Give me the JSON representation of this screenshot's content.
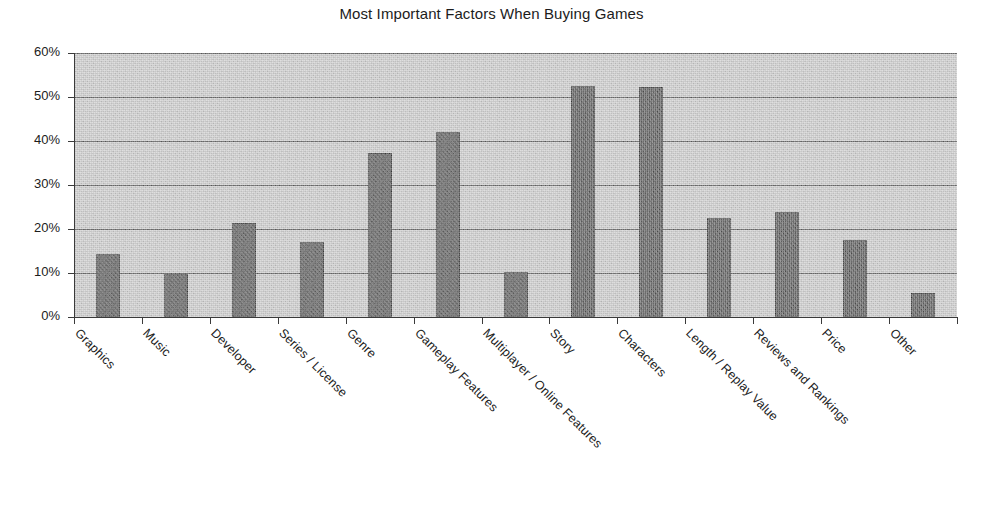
{
  "chart_data": {
    "type": "bar",
    "title": "Most Important Factors When Buying Games",
    "xlabel": "",
    "ylabel": "",
    "ylim": [
      0,
      60
    ],
    "y_tick_labels": [
      "0%",
      "10%",
      "20%",
      "30%",
      "40%",
      "50%",
      "60%"
    ],
    "y_tick_values": [
      0,
      10,
      20,
      30,
      40,
      50,
      60
    ],
    "grid": true,
    "legend": "none",
    "value_unit": "%",
    "categories": [
      "Graphics",
      "Music",
      "Developer",
      "Series / License",
      "Genre",
      "Gameplay Features",
      "Multiplayer / Online Features",
      "Story",
      "Characters",
      "Length / Replay Value",
      "Reviews and Rankings",
      "Price",
      "Other"
    ],
    "values": [
      14.3,
      9.7,
      21.3,
      17.0,
      37.2,
      42.0,
      10.2,
      52.6,
      52.2,
      22.5,
      23.9,
      17.5,
      5.5
    ],
    "series": [
      {
        "name": "Share of respondents",
        "values": [
          14.3,
          9.7,
          21.3,
          17.0,
          37.2,
          42.0,
          10.2,
          52.6,
          52.2,
          22.5,
          23.9,
          17.5,
          5.5
        ]
      }
    ],
    "colors": {
      "bar": "#4d4d4d",
      "bar_border": "#3b3b3b",
      "plot_background": "#c9c9c9",
      "gridline": "#5d5d5d",
      "axis": "#3a3a3a",
      "page_background": "#ffffff",
      "text": "#1c1c1c"
    }
  }
}
